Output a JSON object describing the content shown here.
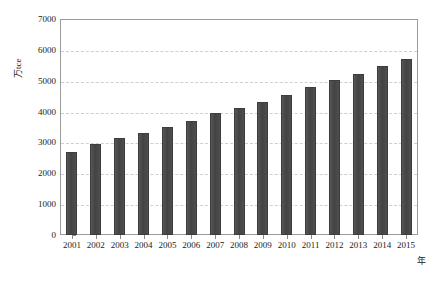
{
  "chart_data": {
    "type": "bar",
    "title": "",
    "subtitle": "",
    "xlabel": "年",
    "ylabel": "万tce",
    "categories": [
      "2001",
      "2002",
      "2003",
      "2004",
      "2005",
      "2006",
      "2007",
      "2008",
      "2009",
      "2010",
      "2011",
      "2012",
      "2013",
      "2014",
      "2015"
    ],
    "values": [
      2700,
      2950,
      3150,
      3300,
      3500,
      3700,
      3950,
      4120,
      4300,
      4550,
      4800,
      5030,
      5230,
      5480,
      5700
    ],
    "series": [
      {
        "name": "能源消费总量",
        "values": [
          2700,
          2950,
          3150,
          3300,
          3500,
          3700,
          3950,
          4120,
          4300,
          4550,
          4800,
          5030,
          5230,
          5480,
          5700
        ]
      }
    ],
    "ylim": [
      0,
      7000
    ],
    "ytick_values": [
      0,
      1000,
      2000,
      3000,
      4000,
      5000,
      6000,
      7000
    ],
    "ytick_labels": [
      "0",
      "1000",
      "2000",
      "3000",
      "4000",
      "5000",
      "6000",
      "7000"
    ],
    "grid": true,
    "grid_axis": "y",
    "grid_style": "dashed",
    "legend": false,
    "legend_position": "none",
    "bar_color": "#4a4a4a",
    "grid_color": "#cfcfcf",
    "frame_color": "#9b9b9b",
    "text_color": "#1c1c1c",
    "background_color": "#ffffff"
  },
  "axes": {
    "y_title": "万tce",
    "x_title": "年"
  }
}
